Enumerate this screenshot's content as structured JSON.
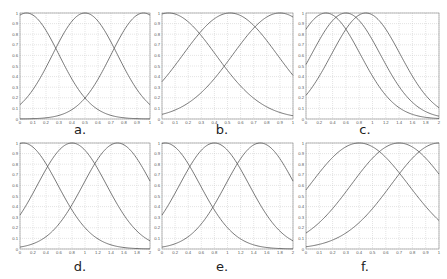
{
  "chart_data": [
    {
      "id": "a",
      "caption": "a.",
      "type": "line",
      "title": "",
      "xlabel": "",
      "ylabel": "",
      "xlim": [
        0,
        1
      ],
      "ylim": [
        0,
        1
      ],
      "grid": true,
      "xticks": [
        "0",
        "0.1",
        "0.2",
        "0.3",
        "0.4",
        "0.5",
        "0.6",
        "0.7",
        "0.8",
        "0.9",
        "1"
      ],
      "yticks": [
        "0",
        "0.1",
        "0.2",
        "0.3",
        "0.4",
        "0.5",
        "0.6",
        "0.7",
        "0.8",
        "0.9",
        "1"
      ],
      "series": [
        {
          "name": "MF1",
          "shape": "gaussian",
          "center": 0.05,
          "sigma": 0.25
        },
        {
          "name": "MF2",
          "shape": "gaussian",
          "center": 0.5,
          "sigma": 0.25
        },
        {
          "name": "MF3",
          "shape": "gaussian",
          "center": 0.95,
          "sigma": 0.25
        }
      ]
    },
    {
      "id": "b",
      "caption": "b.",
      "type": "line",
      "title": "",
      "xlabel": "",
      "ylabel": "",
      "xlim": [
        0,
        1
      ],
      "ylim": [
        0,
        1
      ],
      "grid": true,
      "xticks": [
        "0",
        "0.1",
        "0.2",
        "0.3",
        "0.4",
        "0.5",
        "0.6",
        "0.7",
        "0.8",
        "0.9",
        "1"
      ],
      "yticks": [
        "0",
        "0.1",
        "0.2",
        "0.3",
        "0.4",
        "0.5",
        "0.6",
        "0.7",
        "0.8",
        "0.9",
        "1"
      ],
      "series": [
        {
          "name": "MF1",
          "shape": "gaussian",
          "center": 0.05,
          "sigma": 0.36
        },
        {
          "name": "MF2",
          "shape": "gaussian",
          "center": 0.52,
          "sigma": 0.36
        },
        {
          "name": "MF3",
          "shape": "gaussian",
          "center": 0.9,
          "sigma": 0.36
        }
      ]
    },
    {
      "id": "c",
      "caption": "c.",
      "type": "line",
      "title": "",
      "xlabel": "",
      "ylabel": "",
      "xlim": [
        0,
        2
      ],
      "ylim": [
        0,
        1
      ],
      "grid": true,
      "xticks": [
        "0",
        "0.2",
        "0.4",
        "0.6",
        "0.8",
        "1",
        "1.2",
        "1.4",
        "1.6",
        "1.8",
        "2"
      ],
      "yticks": [
        "0",
        "0.1",
        "0.2",
        "0.3",
        "0.4",
        "0.5",
        "0.6",
        "0.7",
        "0.8",
        "0.9",
        "1"
      ],
      "series": [
        {
          "name": "MF1",
          "shape": "gaussian",
          "center": 0.3,
          "sigma": 0.52
        },
        {
          "name": "MF2",
          "shape": "gaussian",
          "center": 0.6,
          "sigma": 0.52
        },
        {
          "name": "MF3",
          "shape": "gaussian",
          "center": 0.9,
          "sigma": 0.52
        }
      ]
    },
    {
      "id": "d",
      "caption": "d.",
      "type": "line",
      "title": "",
      "xlabel": "",
      "ylabel": "",
      "xlim": [
        0,
        2
      ],
      "ylim": [
        0,
        1
      ],
      "grid": true,
      "xticks": [
        "0",
        "0.2",
        "0.4",
        "0.6",
        "0.8",
        "1",
        "1.2",
        "1.4",
        "1.6",
        "1.8",
        "2"
      ],
      "yticks": [
        "0",
        "0.1",
        "0.2",
        "0.3",
        "0.4",
        "0.5",
        "0.6",
        "0.7",
        "0.8",
        "0.9",
        "1"
      ],
      "series": [
        {
          "name": "MF1",
          "shape": "gaussian",
          "center": 0.05,
          "sigma": 0.53
        },
        {
          "name": "MF2",
          "shape": "gaussian",
          "center": 0.8,
          "sigma": 0.53
        },
        {
          "name": "MF3",
          "shape": "gaussian",
          "center": 1.5,
          "sigma": 0.53
        }
      ]
    },
    {
      "id": "e",
      "caption": "e.",
      "type": "line",
      "title": "",
      "xlabel": "",
      "ylabel": "",
      "xlim": [
        0,
        2
      ],
      "ylim": [
        0,
        1
      ],
      "grid": true,
      "xticks": [
        "0",
        "0.2",
        "0.4",
        "0.6",
        "0.8",
        "1",
        "1.2",
        "1.4",
        "1.6",
        "1.8",
        "2"
      ],
      "yticks": [
        "0",
        "0.1",
        "0.2",
        "0.3",
        "0.4",
        "0.5",
        "0.6",
        "0.7",
        "0.8",
        "0.9",
        "1"
      ],
      "series": [
        {
          "name": "MF1",
          "shape": "gaussian",
          "center": 0.05,
          "sigma": 0.53
        },
        {
          "name": "MF2",
          "shape": "gaussian",
          "center": 0.8,
          "sigma": 0.53
        },
        {
          "name": "MF3",
          "shape": "gaussian",
          "center": 1.5,
          "sigma": 0.53
        }
      ]
    },
    {
      "id": "f",
      "caption": "f.",
      "type": "line",
      "title": "",
      "xlabel": "",
      "ylabel": "",
      "xlim": [
        0,
        1
      ],
      "ylim": [
        0,
        1
      ],
      "grid": true,
      "xticks": [
        "0",
        "0.1",
        "0.2",
        "0.3",
        "0.4",
        "0.5",
        "0.6",
        "0.7",
        "0.8",
        "0.9",
        "1"
      ],
      "yticks": [
        "0",
        "0.1",
        "0.2",
        "0.3",
        "0.4",
        "0.5",
        "0.6",
        "0.7",
        "0.8",
        "0.9",
        "1"
      ],
      "series": [
        {
          "name": "MF1",
          "shape": "gaussian",
          "center": 0.4,
          "sigma": 0.37
        },
        {
          "name": "MF2",
          "shape": "gaussian",
          "center": 0.7,
          "sigma": 0.36
        },
        {
          "name": "MF3",
          "shape": "gaussian",
          "center": 1.0,
          "sigma": 0.36
        }
      ]
    }
  ],
  "layout": {
    "panels": [
      {
        "x": 20,
        "y": 13,
        "w": 130,
        "h": 106,
        "cap_x": 70,
        "cap_y": 122
      },
      {
        "x": 162,
        "y": 13,
        "w": 131,
        "h": 106,
        "cap_x": 212,
        "cap_y": 122
      },
      {
        "x": 306,
        "y": 13,
        "w": 133,
        "h": 106,
        "cap_x": 355,
        "cap_y": 122
      },
      {
        "x": 20,
        "y": 143,
        "w": 130,
        "h": 106,
        "cap_x": 70,
        "cap_y": 259
      },
      {
        "x": 162,
        "y": 143,
        "w": 131,
        "h": 106,
        "cap_x": 212,
        "cap_y": 259
      },
      {
        "x": 306,
        "y": 143,
        "w": 133,
        "h": 106,
        "cap_x": 355,
        "cap_y": 259
      }
    ]
  },
  "colors": {
    "curve": "#555555",
    "grid": "#c8c8c8",
    "axis": "#888888"
  }
}
